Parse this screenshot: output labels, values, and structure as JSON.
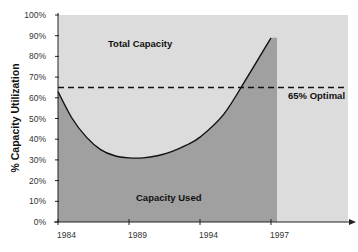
{
  "chart_data": {
    "type": "area",
    "title": "",
    "xlabel": "",
    "ylabel": "% Capacity Utilization",
    "ylim": [
      0,
      100
    ],
    "y_ticks": [
      "0%",
      "10%",
      "20%",
      "30%",
      "40%",
      "50%",
      "60%",
      "70%",
      "80%",
      "90%",
      "100%"
    ],
    "x_ticks": [
      "1984",
      "1989",
      "1994",
      "1997"
    ],
    "grid": false,
    "legend": null,
    "series": [
      {
        "name": "Capacity Used",
        "x": [
          1984,
          1985,
          1986,
          1987,
          1988,
          1989,
          1990,
          1991,
          1992,
          1993,
          1994,
          1995,
          1996,
          1997
        ],
        "values": [
          63,
          50,
          41,
          35,
          32,
          31,
          31,
          32,
          34,
          37,
          41,
          52,
          70,
          89
        ]
      },
      {
        "name": "Total Capacity",
        "values_constant": 100
      },
      {
        "name": "65% Optimal",
        "type": "reference_line",
        "value": 65,
        "style": "dashed"
      }
    ],
    "annotations": [
      "Total Capacity",
      "Capacity Used",
      "65% Optimal"
    ],
    "colors": {
      "total_capacity_fill": "#dcdcdc",
      "capacity_used_fill": "#a0a0a0",
      "curve": "#111111",
      "optimal_line": "#111111"
    }
  },
  "labels": {
    "y_axis": "% Capacity Utilization",
    "total_capacity": "Total Capacity",
    "capacity_used": "Capacity Used",
    "optimal": "65% Optimal"
  }
}
